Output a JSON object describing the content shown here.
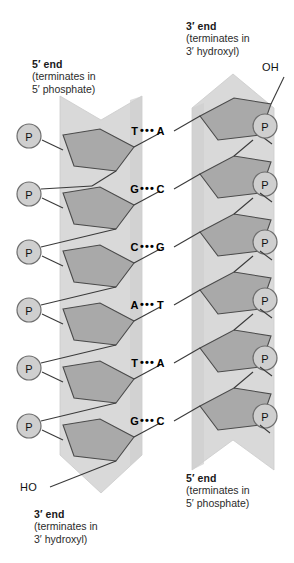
{
  "figure": {
    "colors": {
      "ribbon": "#d9d9d9",
      "ribbon_edge": "#c2c2c2",
      "sugar": "#a9a9a9",
      "sugar_edge": "#4a4a4a",
      "phosphate_fill": "#cfcfcf",
      "phosphate_edge": "#6e6e6e",
      "bond_line": "#3a3a3a",
      "text": "#1a1a1a",
      "background": "#ffffff"
    }
  },
  "labels": {
    "left_top": {
      "title": "5′ end",
      "line2": "(terminates in",
      "line3": "5′ phosphate)"
    },
    "left_bottom": {
      "title": "3′ end",
      "line2": "(terminates in",
      "line3": "3′ hydroxyl)"
    },
    "right_top": {
      "title": "3′ end",
      "line2": "(terminates in",
      "line3": "3′ hydroxyl)"
    },
    "right_bottom": {
      "title": "5′ end",
      "line2": "(terminates in",
      "line3": "5′ phosphate)"
    }
  },
  "terminals": {
    "right_top_hydroxyl": "OH",
    "left_bottom_hydroxyl": "HO"
  },
  "phosphate_label": "P",
  "phosphates": {
    "left_count": 6,
    "right_count": 6
  },
  "base_pairs": [
    {
      "left": "T",
      "bond": "•••",
      "right": "A"
    },
    {
      "left": "G",
      "bond": "•••",
      "right": "C"
    },
    {
      "left": "C",
      "bond": "•••",
      "right": "G"
    },
    {
      "left": "A",
      "bond": "•••",
      "right": "T"
    },
    {
      "left": "T",
      "bond": "•••",
      "right": "A"
    },
    {
      "left": "G",
      "bond": "•••",
      "right": "C"
    }
  ]
}
